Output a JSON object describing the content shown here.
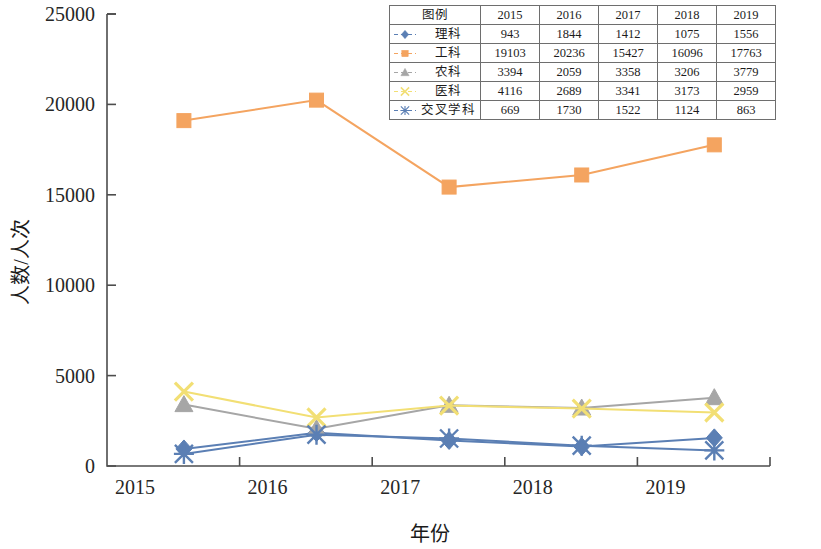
{
  "chart_data": {
    "type": "line",
    "title": "",
    "xlabel": "年份",
    "ylabel": "人数/人次",
    "categories": [
      "2015",
      "2016",
      "2017",
      "2018",
      "2019"
    ],
    "x": [
      2015,
      2016,
      2017,
      2018,
      2019
    ],
    "ylim": [
      0,
      25000
    ],
    "ytick_labels": [
      "0",
      "5000",
      "10000",
      "15000",
      "20000",
      "25000"
    ],
    "ytick_values": [
      0,
      5000,
      10000,
      15000,
      20000,
      25000
    ],
    "xtick_labels": [
      "2015",
      "2016",
      "2017",
      "2018",
      "2019"
    ],
    "grid": false,
    "legend_position": "inside-top-right-table",
    "series": [
      {
        "name": "理科",
        "color": "#5b7fb4",
        "marker": "diamond",
        "values": [
          943,
          1844,
          1412,
          1075,
          1556
        ]
      },
      {
        "name": "工科",
        "color": "#f4a460",
        "marker": "square",
        "values": [
          19103,
          20236,
          15427,
          16096,
          17763
        ]
      },
      {
        "name": "农科",
        "color": "#a6a6a6",
        "marker": "triangle",
        "values": [
          3394,
          2059,
          3358,
          3206,
          3779
        ]
      },
      {
        "name": "医科",
        "color": "#f2df74",
        "marker": "cross",
        "values": [
          4116,
          2689,
          3341,
          3173,
          2959
        ]
      },
      {
        "name": "交叉学科",
        "color": "#5b7fb4",
        "marker": "star",
        "values": [
          669,
          1730,
          1522,
          1124,
          863
        ]
      }
    ]
  },
  "legend_table": {
    "header_label": "图例",
    "year_headers": [
      "2015",
      "2016",
      "2017",
      "2018",
      "2019"
    ],
    "rows": [
      {
        "name": "理科",
        "values": [
          "943",
          "1844",
          "1412",
          "1075",
          "1556"
        ]
      },
      {
        "name": "工科",
        "values": [
          "19103",
          "20236",
          "15427",
          "16096",
          "17763"
        ]
      },
      {
        "name": "农科",
        "values": [
          "3394",
          "2059",
          "3358",
          "3206",
          "3779"
        ]
      },
      {
        "name": "医科",
        "values": [
          "4116",
          "2689",
          "3341",
          "3173",
          "2959"
        ]
      },
      {
        "name": "交叉学科",
        "values": [
          "669",
          "1730",
          "1522",
          "1124",
          "863"
        ]
      }
    ]
  },
  "axis": {
    "y_title": "人数/人次",
    "x_title": "年份",
    "y_ticks": [
      "25000",
      "20000",
      "15000",
      "10000",
      "5000",
      "0"
    ],
    "x_ticks": [
      "2015",
      "2016",
      "2017",
      "2018",
      "2019"
    ]
  },
  "colors": {
    "science": "#5b7fb4",
    "engineering": "#f4a460",
    "agriculture": "#a6a6a6",
    "medicine": "#f2df74",
    "interdisciplinary": "#5b7fb4",
    "axis": "#4d4d4d"
  }
}
